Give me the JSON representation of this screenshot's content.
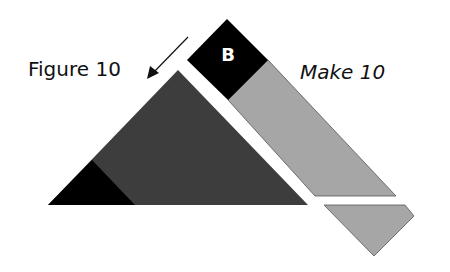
{
  "figure": {
    "title": "Figure 10",
    "instruction": "Make 10",
    "block_label": "B",
    "arrow_icon": "arrow-down-left-icon",
    "colors": {
      "black": "#000000",
      "dark_gray": "#3d3d3d",
      "light_gray": "#a6a6a6",
      "outline": "#555555",
      "background": "#ffffff"
    },
    "shapes": [
      {
        "name": "large-dark-triangle",
        "color": "dark_gray"
      },
      {
        "name": "small-black-triangle",
        "color": "black"
      },
      {
        "name": "black-square-b",
        "color": "black",
        "label": "B"
      },
      {
        "name": "light-gray-strip",
        "color": "light_gray"
      },
      {
        "name": "light-gray-trapezoid",
        "color": "light_gray"
      }
    ]
  }
}
